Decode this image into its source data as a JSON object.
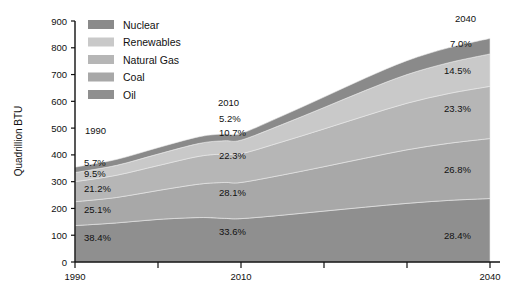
{
  "chart_data": {
    "type": "area",
    "title": "",
    "xlabel": "",
    "ylabel": "Quadrillion BTU",
    "xlim": [
      1990,
      2040
    ],
    "ylim": [
      0,
      900
    ],
    "ytick_labels": [
      "0",
      "100",
      "200",
      "300",
      "400",
      "500",
      "600",
      "700",
      "800",
      "900"
    ],
    "ytick_values": [
      0,
      100,
      200,
      300,
      400,
      500,
      600,
      700,
      800,
      900
    ],
    "xtick_values": [
      1990,
      2000,
      2010,
      2020,
      2030,
      2040
    ],
    "xtick_labels": [
      "1990",
      "",
      "2010",
      "",
      "",
      "2040"
    ],
    "grid": false,
    "legend_position": "top-left-inside",
    "stacked": true,
    "x": [
      1990,
      1995,
      2000,
      2005,
      2008,
      2010,
      2015,
      2020,
      2025,
      2030,
      2035,
      2040
    ],
    "series": [
      {
        "name": "Oil",
        "color": "#8f8f8f",
        "values": [
          136,
          146,
          159,
          166,
          163,
          162,
          175,
          190,
          205,
          219,
          230,
          237
        ]
      },
      {
        "name": "Coal",
        "color": "#a8a8a8",
        "values": [
          89,
          95,
          108,
          125,
          134,
          135,
          150,
          166,
          183,
          200,
          213,
          224
        ]
      },
      {
        "name": "Natural Gas",
        "color": "#b6b6b6",
        "values": [
          75,
          83,
          93,
          104,
          106,
          107,
          124,
          141,
          158,
          174,
          186,
          195
        ]
      },
      {
        "name": "Renewables",
        "color": "#c9c9c9",
        "values": [
          34,
          37,
          43,
          48,
          50,
          51,
          65,
          80,
          95,
          107,
          115,
          121
        ]
      },
      {
        "name": "Nuclear",
        "color": "#8a8a8a",
        "values": [
          20,
          22,
          24,
          25,
          25,
          25,
          32,
          39,
          46,
          52,
          56,
          58
        ]
      }
    ],
    "annotations": [
      {
        "name": "year-1990",
        "text": "1990",
        "x": 85,
        "y": 134
      },
      {
        "name": "year-2010",
        "text": "2010",
        "x": 218,
        "y": 106
      },
      {
        "name": "year-2040",
        "text": "2040",
        "x": 455,
        "y": 22
      },
      {
        "name": "pct-1990-nuclear",
        "text": "5.7%",
        "x": 84,
        "y": 166
      },
      {
        "name": "pct-1990-renewables",
        "text": "9.5%",
        "x": 84,
        "y": 177
      },
      {
        "name": "pct-1990-natural-gas",
        "text": "21.2%",
        "x": 84,
        "y": 192
      },
      {
        "name": "pct-1990-coal",
        "text": "25.1%",
        "x": 84,
        "y": 213
      },
      {
        "name": "pct-1990-oil",
        "text": "38.4%",
        "x": 84,
        "y": 241
      },
      {
        "name": "pct-2010-nuclear",
        "text": "5.2%",
        "x": 219,
        "y": 122
      },
      {
        "name": "pct-2010-renewables",
        "text": "10.7%",
        "x": 219,
        "y": 136
      },
      {
        "name": "pct-2010-natural-gas",
        "text": "22.3%",
        "x": 219,
        "y": 159
      },
      {
        "name": "pct-2010-coal",
        "text": "28.1%",
        "x": 219,
        "y": 196
      },
      {
        "name": "pct-2010-oil",
        "text": "33.6%",
        "x": 219,
        "y": 235
      },
      {
        "name": "pct-2040-nuclear",
        "text": "7.0%",
        "x": 450,
        "y": 47
      },
      {
        "name": "pct-2040-renewables",
        "text": "14.5%",
        "x": 444,
        "y": 74
      },
      {
        "name": "pct-2040-natural-gas",
        "text": "23.3%",
        "x": 444,
        "y": 112
      },
      {
        "name": "pct-2040-coal",
        "text": "26.8%",
        "x": 444,
        "y": 173
      },
      {
        "name": "pct-2040-oil",
        "text": "28.4%",
        "x": 444,
        "y": 239
      }
    ]
  },
  "legend": {
    "items": [
      {
        "label": "Nuclear",
        "color": "#8a8a8a"
      },
      {
        "label": "Renewables",
        "color": "#c9c9c9"
      },
      {
        "label": "Natural Gas",
        "color": "#b6b6b6"
      },
      {
        "label": "Coal",
        "color": "#a8a8a8"
      },
      {
        "label": "Oil",
        "color": "#8f8f8f"
      }
    ]
  },
  "axes": {
    "y_title": "Quadrillion BTU",
    "y_ticks": [
      "900",
      "800",
      "700",
      "600",
      "500",
      "400",
      "300",
      "200",
      "100",
      "0"
    ],
    "x_ticks": [
      "1990",
      "2010",
      "2040"
    ]
  }
}
